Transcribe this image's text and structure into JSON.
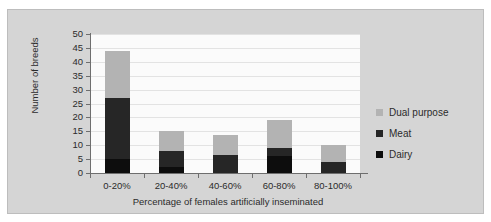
{
  "chart_data": {
    "type": "bar",
    "subtype": "stacked-bar",
    "title": "",
    "xlabel": "Percentage of females artificially inseminated",
    "ylabel": "Number of breeds",
    "categories": [
      "0-20%",
      "20-40%",
      "40-60%",
      "60-80%",
      "80-100%"
    ],
    "series": [
      {
        "name": "Dairy",
        "color": "#0d0d0d",
        "values": [
          5,
          2,
          0,
          6,
          0
        ]
      },
      {
        "name": "Meat",
        "color": "#262626",
        "values": [
          22,
          6,
          6.5,
          3,
          4
        ]
      },
      {
        "name": "Dual purpose",
        "color": "#b3b3b3",
        "values": [
          17,
          7,
          7,
          10,
          6
        ]
      }
    ],
    "totals": [
      44,
      15,
      13.5,
      19,
      10
    ],
    "ylim": [
      0,
      50
    ],
    "ytick_step": 5,
    "yticks": [
      "50",
      "45",
      "40",
      "35",
      "30",
      "25",
      "20",
      "15",
      "10",
      "5",
      "0"
    ],
    "grid": true,
    "legend_position": "right",
    "legend_order": [
      "Dual purpose",
      "Meat",
      "Dairy"
    ]
  },
  "legend": {
    "items": [
      {
        "label": "Dual purpose",
        "color": "#b3b3b3"
      },
      {
        "label": "Meat",
        "color": "#262626"
      },
      {
        "label": "Dairy",
        "color": "#0d0d0d"
      }
    ]
  },
  "colors": {
    "background": "#d5d5d5",
    "plot_background": "#fbfbfb",
    "gridline": "#e3e3e3",
    "axis": "#6e6e6e",
    "text": "#2b2b2b"
  }
}
